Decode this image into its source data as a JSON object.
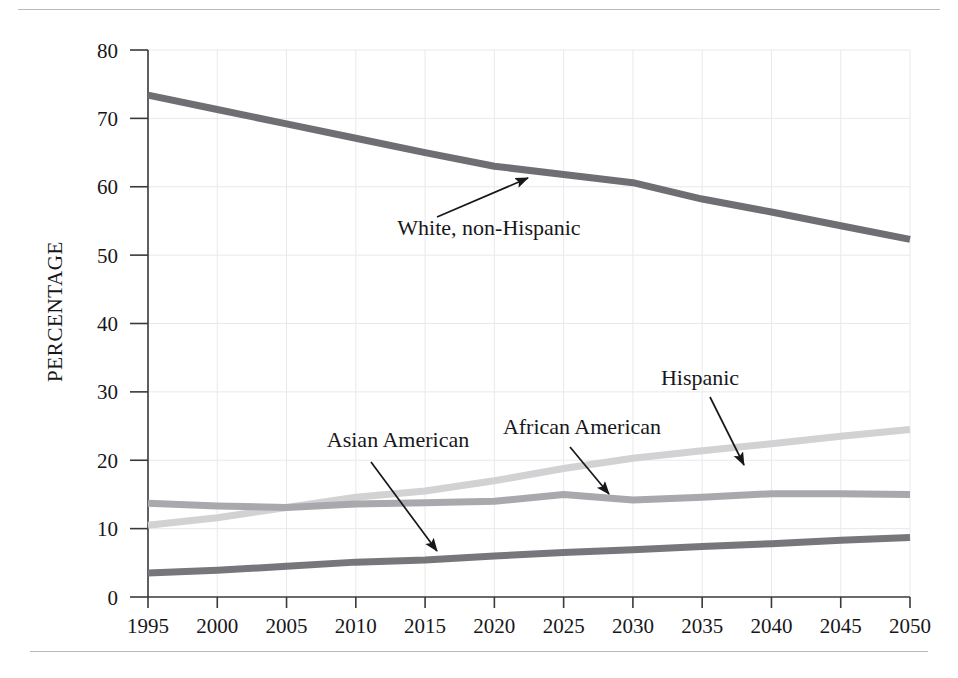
{
  "figure": {
    "background_color": "#ffffff",
    "rule_color": "#b9b9bd",
    "axis_color": "#3a3a3c",
    "grid_color": "#e9e9ec",
    "text_color": "#17171a"
  },
  "chart_data": {
    "type": "line",
    "title": "",
    "xlabel": "",
    "ylabel": "PERCENTAGE",
    "x": [
      1995,
      2000,
      2005,
      2010,
      2015,
      2020,
      2025,
      2030,
      2035,
      2040,
      2045,
      2050
    ],
    "xlim": [
      1995,
      2050
    ],
    "ylim": [
      0,
      80
    ],
    "yticks": [
      0,
      10,
      20,
      30,
      40,
      50,
      60,
      70,
      80
    ],
    "xticks": [
      1995,
      2000,
      2005,
      2010,
      2015,
      2020,
      2025,
      2030,
      2035,
      2040,
      2045,
      2050
    ],
    "ytick_labels": [
      "0",
      "10",
      "20",
      "30",
      "40",
      "50",
      "60",
      "70",
      "80"
    ],
    "xtick_labels": [
      "1995",
      "2000",
      "2005",
      "2010",
      "2015",
      "2020",
      "2025",
      "2030",
      "2035",
      "2040",
      "2045",
      "2050"
    ],
    "grid": true,
    "legend": "annotations",
    "series": [
      {
        "name": "White, non-Hispanic",
        "color": "#6f6f73",
        "line_width": 7,
        "values": [
          73.4,
          71.3,
          69.2,
          67.1,
          65.0,
          63.0,
          61.8,
          60.6,
          58.2,
          56.3,
          54.3,
          52.3
        ]
      },
      {
        "name": "African American",
        "color": "#a9a9ad",
        "line_width": 7,
        "values": [
          13.7,
          13.3,
          13.1,
          13.6,
          13.8,
          14.0,
          15.0,
          14.2,
          14.6,
          15.1,
          15.1,
          15.0
        ]
      },
      {
        "name": "Hispanic",
        "color": "#d2d2d4",
        "line_width": 7,
        "values": [
          10.5,
          11.6,
          13.1,
          14.6,
          15.5,
          17.0,
          18.8,
          20.3,
          21.4,
          22.4,
          23.5,
          24.5
        ]
      },
      {
        "name": "Asian American",
        "color": "#77777b",
        "line_width": 7,
        "values": [
          3.5,
          3.9,
          4.5,
          5.1,
          5.4,
          6.0,
          6.5,
          6.9,
          7.4,
          7.8,
          8.3,
          8.7
        ]
      }
    ],
    "annotations": [
      {
        "text": "White, non-Hispanic",
        "series": "White, non-Hispanic",
        "label_x": 489,
        "label_y": 235,
        "arrow_from_x": 437,
        "arrow_from_y": 217,
        "arrow_to_x": 528,
        "arrow_to_y": 178
      },
      {
        "text": "Asian American",
        "series": "Asian American",
        "label_x": 398,
        "label_y": 447,
        "arrow_from_x": 371,
        "arrow_from_y": 462,
        "arrow_to_x": 437,
        "arrow_to_y": 551
      },
      {
        "text": "African American",
        "series": "African American",
        "label_x": 582,
        "label_y": 434,
        "arrow_from_x": 570,
        "arrow_from_y": 447,
        "arrow_to_x": 609,
        "arrow_to_y": 494
      },
      {
        "text": "Hispanic",
        "series": "Hispanic",
        "label_x": 700,
        "label_y": 385,
        "arrow_from_x": 710,
        "arrow_from_y": 397,
        "arrow_to_x": 744,
        "arrow_to_y": 465
      }
    ]
  }
}
